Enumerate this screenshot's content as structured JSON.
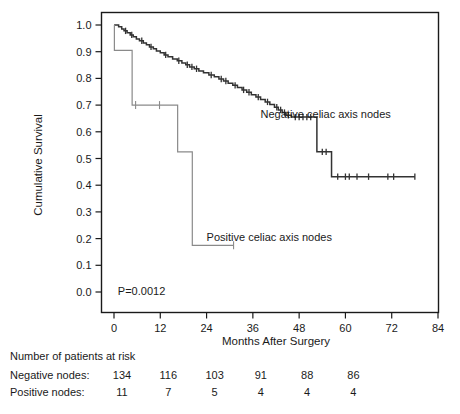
{
  "chart_data": {
    "type": "line",
    "title": "",
    "subtitle": "",
    "xlabel": "Months After Surgery",
    "ylabel": "Cumulative Survival",
    "xlim": [
      0,
      84
    ],
    "ylim": [
      0.0,
      1.0
    ],
    "xticks": [
      "0",
      "12",
      "24",
      "36",
      "48",
      "60",
      "72",
      "84"
    ],
    "yticks": [
      "0.0",
      "0.1",
      "0.2",
      "0.3",
      "0.4",
      "0.5",
      "0.6",
      "0.7",
      "0.8",
      "0.9",
      "1.0"
    ],
    "grid": false,
    "legend_position": "inline-annotation",
    "annotations": [
      {
        "id": "pvalue",
        "text": "P=0.0012",
        "x_months": 1.0,
        "y_value": 0.005
      },
      {
        "id": "label-negative",
        "text": "Negative celiac axis nodes",
        "x_months": 38.0,
        "y_value": 0.665
      },
      {
        "id": "label-positive",
        "text": "Positive celiac axis nodes",
        "x_months": 24.0,
        "y_value": 0.205
      }
    ],
    "series": [
      {
        "name": "Negative celiac axis nodes",
        "color": "#333333",
        "style": "step",
        "points": [
          [
            0.0,
            1.0
          ],
          [
            1.2,
            0.993
          ],
          [
            2.0,
            0.985
          ],
          [
            2.6,
            0.978
          ],
          [
            3.4,
            0.971
          ],
          [
            4.2,
            0.963
          ],
          [
            5.0,
            0.956
          ],
          [
            5.8,
            0.948
          ],
          [
            6.6,
            0.941
          ],
          [
            7.6,
            0.933
          ],
          [
            8.4,
            0.926
          ],
          [
            9.2,
            0.918
          ],
          [
            10.2,
            0.911
          ],
          [
            11.0,
            0.903
          ],
          [
            12.0,
            0.896
          ],
          [
            13.0,
            0.888
          ],
          [
            14.0,
            0.881
          ],
          [
            15.2,
            0.873
          ],
          [
            16.4,
            0.866
          ],
          [
            17.6,
            0.858
          ],
          [
            18.6,
            0.851
          ],
          [
            19.6,
            0.843
          ],
          [
            20.8,
            0.836
          ],
          [
            22.0,
            0.828
          ],
          [
            23.2,
            0.821
          ],
          [
            24.6,
            0.813
          ],
          [
            26.0,
            0.806
          ],
          [
            27.2,
            0.798
          ],
          [
            28.4,
            0.79
          ],
          [
            29.6,
            0.782
          ],
          [
            30.8,
            0.774
          ],
          [
            32.0,
            0.766
          ],
          [
            33.2,
            0.757
          ],
          [
            34.4,
            0.748
          ],
          [
            35.6,
            0.739
          ],
          [
            36.8,
            0.73
          ],
          [
            38.0,
            0.721
          ],
          [
            39.2,
            0.712
          ],
          [
            40.4,
            0.702
          ],
          [
            41.6,
            0.692
          ],
          [
            42.6,
            0.682
          ],
          [
            43.6,
            0.672
          ],
          [
            44.6,
            0.662
          ],
          [
            46.0,
            0.655
          ],
          [
            52.0,
            0.655
          ],
          [
            52.6,
            0.525
          ],
          [
            56.0,
            0.525
          ],
          [
            56.4,
            0.432
          ],
          [
            78.0,
            0.432
          ]
        ],
        "censored_months": [
          3.0,
          4.6,
          7.2,
          9.6,
          13.4,
          16.8,
          19.0,
          20.2,
          21.4,
          25.2,
          27.8,
          29.0,
          31.4,
          33.6,
          35.0,
          37.4,
          39.8,
          42.2,
          43.2,
          44.2,
          45.2,
          47.0,
          48.0,
          49.0,
          50.0,
          51.0,
          54.0,
          55.0,
          58.0,
          60.0,
          61.0,
          63.0,
          66.0,
          71.0,
          72.5,
          78.0
        ]
      },
      {
        "name": "Positive celiac axis nodes",
        "color": "#8a8a8a",
        "style": "step",
        "points": [
          [
            0.0,
            1.0
          ],
          [
            0.1,
            0.905
          ],
          [
            4.6,
            0.905
          ],
          [
            4.7,
            0.7
          ],
          [
            16.4,
            0.7
          ],
          [
            16.5,
            0.525
          ],
          [
            20.2,
            0.525
          ],
          [
            20.3,
            0.175
          ],
          [
            31.0,
            0.175
          ]
        ],
        "censored_months": [
          5.6,
          11.8,
          31.0
        ]
      }
    ],
    "risk_table": {
      "caption": "Number of patients at risk",
      "time_points": [
        0,
        12,
        24,
        36,
        48,
        60
      ],
      "rows": [
        {
          "label": "Negative nodes:",
          "values": [
            "134",
            "116",
            "103",
            "91",
            "88",
            "86"
          ]
        },
        {
          "label": "Positive nodes:",
          "values": [
            "11",
            "7",
            "5",
            "4",
            "4",
            "4"
          ]
        }
      ]
    }
  }
}
